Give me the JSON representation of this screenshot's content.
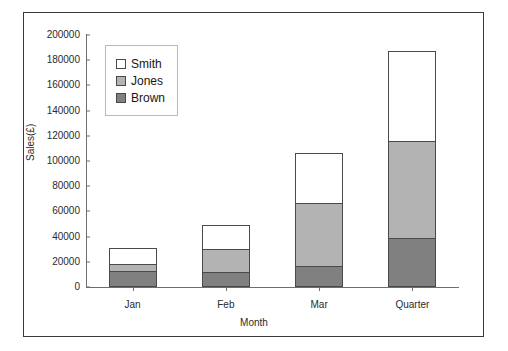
{
  "chart_data": {
    "type": "bar",
    "subtype": "stacked-column",
    "title": "",
    "xlabel": "Month",
    "ylabel": "Sales(£)",
    "categories": [
      "Jan",
      "Feb",
      "Mar",
      "Quarter"
    ],
    "ylim": [
      0,
      200000
    ],
    "ytick_step": 20000,
    "yticks": [
      "200000",
      "180000",
      "160000",
      "140000",
      "120000",
      "100000",
      "80000",
      "60000",
      "40000",
      "20000",
      "0"
    ],
    "grid": false,
    "legend_position": "inside-top-left",
    "stack_order_bottom_to_top": [
      "Brown",
      "Jones",
      "Smith"
    ],
    "series": [
      {
        "name": "Smith",
        "color": "#FFFFFF",
        "values": [
          13000,
          19000,
          39000,
          71000
        ]
      },
      {
        "name": "Jones",
        "color": "#B3B3B3",
        "values": [
          5000,
          18000,
          50000,
          77000
        ]
      },
      {
        "name": "Brown",
        "color": "#808080",
        "values": [
          13000,
          12000,
          17000,
          39000
        ]
      }
    ],
    "totals": [
      31000,
      49000,
      106000,
      187000
    ]
  },
  "legend": {
    "entries": [
      {
        "label": "Smith",
        "color": "#FFFFFF"
      },
      {
        "label": "Jones",
        "color": "#B3B3B3"
      },
      {
        "label": "Brown",
        "color": "#808080"
      }
    ]
  },
  "colors": {
    "frame": "#3a3a3a",
    "axis": "#6e6e6e",
    "bar_outline": "#4a4a4a",
    "text": "#2b2b2b",
    "background": "#FFFFFF"
  }
}
